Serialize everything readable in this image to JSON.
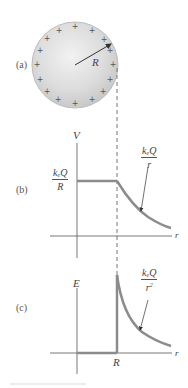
{
  "figure": {
    "panels": {
      "a": {
        "label": "(a)",
        "description": "Uniformly charged conducting sphere of radius R",
        "radius_label": "R",
        "charge_symbol": "+",
        "charge_count": 18,
        "sphere_fill": "#d9d9d9",
        "sphere_edge": "#bdbdbd"
      },
      "b": {
        "label": "(b)",
        "y_axis_label": "V",
        "x_axis_label": "r",
        "inside_value": {
          "num_k": "k",
          "num_sub": "e",
          "num_rest": "Q",
          "den": "R"
        },
        "outside_curve": {
          "num_k": "k",
          "num_sub": "e",
          "num_rest": "Q",
          "den": "r"
        }
      },
      "c": {
        "label": "(c)",
        "y_axis_label": "E",
        "x_axis_label": "r",
        "x_tick_label": "R",
        "outside_curve": {
          "num_k": "k",
          "num_sub": "e",
          "num_rest": "Q",
          "den": "r",
          "den_sup": "2"
        }
      }
    },
    "colors": {
      "curve": "#8c8c8c",
      "axis": "#555555",
      "dashed": "#777777",
      "text": "#444444"
    }
  }
}
